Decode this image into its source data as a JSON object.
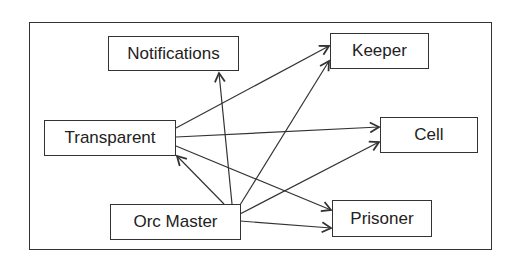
{
  "diagram": {
    "type": "directed-graph",
    "nodes": [
      {
        "id": "notifications",
        "label": "Notifications"
      },
      {
        "id": "keeper",
        "label": "Keeper"
      },
      {
        "id": "transparent",
        "label": "Transparent"
      },
      {
        "id": "cell",
        "label": "Cell"
      },
      {
        "id": "orc_master",
        "label": "Orc Master"
      },
      {
        "id": "prisoner",
        "label": "Prisoner"
      }
    ],
    "edges": [
      {
        "from": "transparent",
        "to": "keeper"
      },
      {
        "from": "transparent",
        "to": "cell"
      },
      {
        "from": "transparent",
        "to": "prisoner"
      },
      {
        "from": "orc_master",
        "to": "notifications"
      },
      {
        "from": "orc_master",
        "to": "transparent"
      },
      {
        "from": "orc_master",
        "to": "keeper"
      },
      {
        "from": "orc_master",
        "to": "cell"
      },
      {
        "from": "orc_master",
        "to": "prisoner"
      }
    ],
    "colors": {
      "line": "#333333",
      "text": "#222222",
      "background": "#ffffff"
    }
  }
}
